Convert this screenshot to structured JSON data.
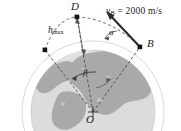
{
  "figure": {
    "type": "orbital-trajectory-diagram",
    "background_color": "#ffffff"
  },
  "labels": {
    "apogee_point": "D",
    "launch_point": "B",
    "earth_center": "O",
    "max_height": "h",
    "max_height_sub": "max",
    "velocity_angle": "α",
    "range_angle": "β",
    "velocity_symbol": "v",
    "velocity_sub": "B",
    "velocity_equals": "=",
    "velocity_value": "2000",
    "velocity_units": "m/s",
    "velocity_text": "v_B = 2000 m/s"
  },
  "colors": {
    "earth_ocean": "#d9d9d9",
    "earth_land": "#a8a8a8",
    "earth_outline": "#bfbfbf",
    "trajectory": "#7a7a7a",
    "radius_line": "#4a4a4a",
    "marker": "#1a1a1a",
    "vector": "#2b2b2b",
    "text": "#1a1a1a"
  },
  "geometry": {
    "earth_center_px": [
      93,
      112
    ],
    "earth_radius_px": 62,
    "apogee_px": [
      77,
      17
    ],
    "point_b_px": [
      140,
      47
    ],
    "point_left_px": [
      45,
      50
    ],
    "vector_tip_px": [
      107,
      12
    ]
  }
}
